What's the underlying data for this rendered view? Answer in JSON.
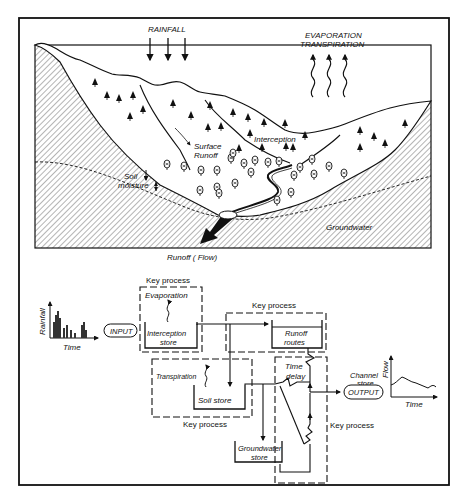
{
  "landscape": {
    "rainfall_label": "RAINFALL",
    "evaporation_label": "EVAPORATION",
    "transpiration_label": "TRANSPIRATION",
    "interception_label": "Interception",
    "surface_runoff_label_1": "Surface",
    "surface_runoff_label_2": "Runoff",
    "soil_moisture_label_1": "Soil",
    "soil_moisture_label_2": "moisture",
    "groundwater_label": "Groundwater",
    "runoff_flow_label": "Runoff ( Flow)"
  },
  "model": {
    "input_chart": {
      "ylabel": "Rainfall",
      "xlabel": "Time"
    },
    "input_label": "INPUT",
    "output_label": "OUTPUT",
    "output_chart": {
      "ylabel": "Flow",
      "xlabel": "Time"
    },
    "channel_store_1": "Channel",
    "channel_store_2": "store",
    "key_process_label": "Key process",
    "evaporation": "Evaporation",
    "transpiration": "Transpiration",
    "interception_store_1": "Interception",
    "interception_store_2": "store",
    "runoff_routes_1": "Runoff",
    "runoff_routes_2": "routes",
    "soil_store": "Soil   store",
    "groundwater_store_1": "Groundwater",
    "groundwater_store_2": "store",
    "time_delay_1": "Time",
    "time_delay_2": "delay"
  }
}
